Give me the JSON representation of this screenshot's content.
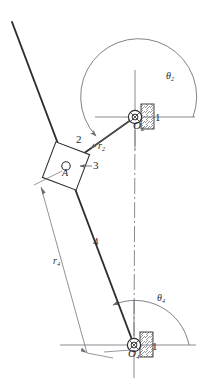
{
  "diagram": {
    "colors": {
      "link_stroke": "#2f2f2f",
      "thin_stroke": "#6b6b76",
      "centerline": "#7a7a86",
      "label_text": "#2b2b2b",
      "background": "#ffffff"
    },
    "joints": [
      {
        "name": "O2",
        "label": "O",
        "sub": "2",
        "x": 135,
        "y": 117,
        "type": "pin-joint-ground"
      },
      {
        "name": "A",
        "label": "A",
        "sub": "",
        "x": 66,
        "y": 166,
        "type": "pin-joint-slider"
      },
      {
        "name": "O4",
        "label": "O",
        "sub": "4",
        "x": 134,
        "y": 345,
        "type": "pin-joint-ground"
      }
    ],
    "link_labels": [
      {
        "name": "ground-upper",
        "text": "1",
        "x": 155,
        "y": 119
      },
      {
        "name": "link-2",
        "text": "2",
        "x": 79,
        "y": 141
      },
      {
        "name": "link-3",
        "text": "3",
        "x": 93,
        "y": 166
      },
      {
        "name": "link-4",
        "text": "4",
        "x": 95,
        "y": 242
      },
      {
        "name": "ground-lower",
        "text": "1",
        "x": 152,
        "y": 348
      }
    ],
    "vectors": [
      {
        "name": "r2",
        "label": "r",
        "sub": "2",
        "x": 101,
        "y": 146,
        "from": "O2",
        "to": "A"
      },
      {
        "name": "r4",
        "label": "r",
        "sub": "4",
        "x": 56,
        "y": 263,
        "from": "O4",
        "to": "A"
      }
    ],
    "angles": [
      {
        "name": "theta2",
        "label": "θ",
        "sub": "2",
        "x": 168,
        "y": 78,
        "measured_from": "positive-x-axis-at-O2",
        "to": "link-2"
      },
      {
        "name": "theta4",
        "label": "θ",
        "sub": "4",
        "x": 160,
        "y": 300,
        "measured_from": "positive-x-axis-at-O4",
        "to": "link-4"
      }
    ],
    "axes": [
      {
        "name": "x-axis-O2",
        "type": "horizontal-reference",
        "y": 117
      },
      {
        "name": "y-axis-O2",
        "type": "vertical-reference",
        "x": 135
      },
      {
        "name": "x-axis-O4",
        "type": "horizontal-reference",
        "y": 345
      },
      {
        "name": "y-axis-O4",
        "type": "vertical-reference",
        "x": 134
      },
      {
        "name": "ground-centerline",
        "type": "dash-dot",
        "from": "O2",
        "to": "O4"
      }
    ]
  }
}
